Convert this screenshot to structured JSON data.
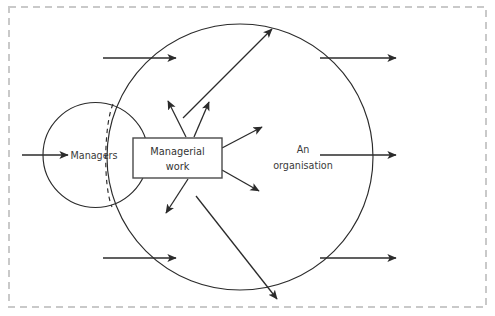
{
  "figure": {
    "title_visible": false,
    "background_color": "#ffffff",
    "frame": {
      "style": "dashed",
      "color": "#c9c9c9"
    },
    "labels": {
      "managers": "Managers",
      "managerial_work_line1": "Managerial",
      "managerial_work_line2": "work",
      "organisation_line1": "An",
      "organisation_line2": "organisation"
    },
    "colors": {
      "stroke": "#2b2b2b",
      "box_stroke": "#4a4a4a",
      "text": "#3a3a3a",
      "frame": "#c9c9c9"
    },
    "elements": {
      "managers_circle": "circle",
      "organisation_circle": "circle",
      "managerial_work_box": "rectangle",
      "dashed_boundary_arc": "dashed-arc",
      "input_arrows": 2,
      "output_arrows": 3,
      "radiating_arrows": 5,
      "diagonal_arrows": 2
    }
  }
}
